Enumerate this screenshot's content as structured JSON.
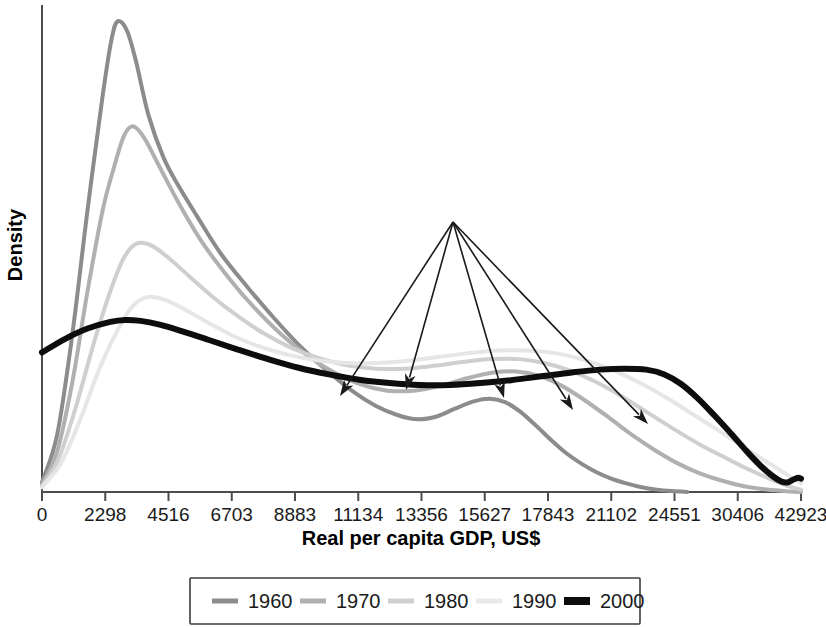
{
  "chart_data": {
    "type": "line",
    "title": "",
    "subtitle": "",
    "xlabel": "Real per capita GDP, US$",
    "ylabel": "Density",
    "grid": false,
    "legend_position": "bottom",
    "x_axis_note": "quantile-spaced: tick labels are unequal in value but equally spaced in pixels",
    "xtick_labels": [
      "0",
      "2298",
      "4516",
      "6703",
      "8883",
      "11134",
      "13356",
      "15627",
      "17843",
      "21102",
      "24551",
      "30406",
      "42923"
    ],
    "xtick_values": [
      0,
      2298,
      4516,
      6703,
      8883,
      11134,
      13356,
      15627,
      17843,
      21102,
      24551,
      30406,
      42923
    ],
    "ytick_labels": [],
    "ylim": [
      0,
      1
    ],
    "series": [
      {
        "name": "1960",
        "color": "#8c8c8c",
        "width": 4,
        "points": [
          [
            0.0,
            0.02
          ],
          [
            0.02,
            0.12
          ],
          [
            0.04,
            0.33
          ],
          [
            0.06,
            0.59
          ],
          [
            0.08,
            0.83
          ],
          [
            0.092,
            0.95
          ],
          [
            0.1,
            0.985
          ],
          [
            0.112,
            0.965
          ],
          [
            0.124,
            0.9
          ],
          [
            0.14,
            0.79
          ],
          [
            0.16,
            0.7
          ],
          [
            0.18,
            0.64
          ],
          [
            0.205,
            0.575
          ],
          [
            0.235,
            0.5
          ],
          [
            0.27,
            0.43
          ],
          [
            0.305,
            0.365
          ],
          [
            0.34,
            0.305
          ],
          [
            0.375,
            0.255
          ],
          [
            0.41,
            0.21
          ],
          [
            0.44,
            0.18
          ],
          [
            0.47,
            0.16
          ],
          [
            0.495,
            0.152
          ],
          [
            0.52,
            0.158
          ],
          [
            0.545,
            0.175
          ],
          [
            0.57,
            0.19
          ],
          [
            0.59,
            0.195
          ],
          [
            0.61,
            0.188
          ],
          [
            0.63,
            0.168
          ],
          [
            0.65,
            0.14
          ],
          [
            0.67,
            0.11
          ],
          [
            0.69,
            0.082
          ],
          [
            0.71,
            0.06
          ],
          [
            0.73,
            0.042
          ],
          [
            0.75,
            0.028
          ],
          [
            0.77,
            0.018
          ],
          [
            0.79,
            0.01
          ],
          [
            0.81,
            0.005
          ],
          [
            0.83,
            0.002
          ],
          [
            0.85,
            0.0
          ]
        ]
      },
      {
        "name": "1970",
        "color": "#b0b0b0",
        "width": 4,
        "points": [
          [
            0.0,
            0.015
          ],
          [
            0.02,
            0.085
          ],
          [
            0.04,
            0.23
          ],
          [
            0.06,
            0.42
          ],
          [
            0.08,
            0.59
          ],
          [
            0.095,
            0.68
          ],
          [
            0.108,
            0.745
          ],
          [
            0.12,
            0.765
          ],
          [
            0.135,
            0.74
          ],
          [
            0.155,
            0.68
          ],
          [
            0.18,
            0.605
          ],
          [
            0.21,
            0.525
          ],
          [
            0.245,
            0.45
          ],
          [
            0.28,
            0.385
          ],
          [
            0.315,
            0.33
          ],
          [
            0.35,
            0.285
          ],
          [
            0.385,
            0.25
          ],
          [
            0.42,
            0.225
          ],
          [
            0.455,
            0.212
          ],
          [
            0.49,
            0.212
          ],
          [
            0.525,
            0.222
          ],
          [
            0.56,
            0.238
          ],
          [
            0.595,
            0.25
          ],
          [
            0.625,
            0.252
          ],
          [
            0.655,
            0.243
          ],
          [
            0.685,
            0.222
          ],
          [
            0.715,
            0.192
          ],
          [
            0.745,
            0.158
          ],
          [
            0.775,
            0.122
          ],
          [
            0.805,
            0.09
          ],
          [
            0.835,
            0.062
          ],
          [
            0.865,
            0.04
          ],
          [
            0.895,
            0.024
          ],
          [
            0.925,
            0.012
          ],
          [
            0.955,
            0.005
          ],
          [
            0.985,
            0.001
          ],
          [
            1.0,
            0.0
          ]
        ]
      },
      {
        "name": "1980",
        "color": "#cfcfcf",
        "width": 4,
        "points": [
          [
            0.0,
            0.012
          ],
          [
            0.022,
            0.07
          ],
          [
            0.045,
            0.18
          ],
          [
            0.068,
            0.31
          ],
          [
            0.09,
            0.42
          ],
          [
            0.108,
            0.49
          ],
          [
            0.125,
            0.52
          ],
          [
            0.145,
            0.515
          ],
          [
            0.168,
            0.488
          ],
          [
            0.195,
            0.45
          ],
          [
            0.225,
            0.408
          ],
          [
            0.258,
            0.368
          ],
          [
            0.292,
            0.332
          ],
          [
            0.328,
            0.302
          ],
          [
            0.365,
            0.28
          ],
          [
            0.402,
            0.265
          ],
          [
            0.44,
            0.258
          ],
          [
            0.478,
            0.258
          ],
          [
            0.516,
            0.264
          ],
          [
            0.554,
            0.272
          ],
          [
            0.592,
            0.278
          ],
          [
            0.628,
            0.278
          ],
          [
            0.662,
            0.27
          ],
          [
            0.696,
            0.254
          ],
          [
            0.73,
            0.23
          ],
          [
            0.764,
            0.2
          ],
          [
            0.798,
            0.166
          ],
          [
            0.832,
            0.132
          ],
          [
            0.866,
            0.1
          ],
          [
            0.9,
            0.072
          ],
          [
            0.93,
            0.048
          ],
          [
            0.958,
            0.028
          ],
          [
            0.98,
            0.014
          ],
          [
            1.0,
            0.005
          ]
        ]
      },
      {
        "name": "1990",
        "color": "#e6e6e6",
        "width": 4,
        "points": [
          [
            0.0,
            0.01
          ],
          [
            0.025,
            0.06
          ],
          [
            0.05,
            0.15
          ],
          [
            0.075,
            0.255
          ],
          [
            0.1,
            0.34
          ],
          [
            0.12,
            0.39
          ],
          [
            0.14,
            0.408
          ],
          [
            0.162,
            0.402
          ],
          [
            0.188,
            0.382
          ],
          [
            0.218,
            0.355
          ],
          [
            0.25,
            0.328
          ],
          [
            0.285,
            0.305
          ],
          [
            0.322,
            0.288
          ],
          [
            0.36,
            0.276
          ],
          [
            0.4,
            0.27
          ],
          [
            0.44,
            0.27
          ],
          [
            0.48,
            0.274
          ],
          [
            0.52,
            0.282
          ],
          [
            0.56,
            0.29
          ],
          [
            0.6,
            0.296
          ],
          [
            0.64,
            0.296
          ],
          [
            0.678,
            0.29
          ],
          [
            0.715,
            0.276
          ],
          [
            0.752,
            0.255
          ],
          [
            0.788,
            0.228
          ],
          [
            0.824,
            0.196
          ],
          [
            0.858,
            0.162
          ],
          [
            0.892,
            0.128
          ],
          [
            0.924,
            0.095
          ],
          [
            0.952,
            0.066
          ],
          [
            0.976,
            0.042
          ],
          [
            0.992,
            0.026
          ],
          [
            1.0,
            0.018
          ]
        ]
      },
      {
        "name": "2000",
        "color": "#0d0d0d",
        "width": 6,
        "points": [
          [
            0.0,
            0.292
          ],
          [
            0.03,
            0.32
          ],
          [
            0.06,
            0.342
          ],
          [
            0.09,
            0.356
          ],
          [
            0.11,
            0.36
          ],
          [
            0.13,
            0.358
          ],
          [
            0.155,
            0.35
          ],
          [
            0.185,
            0.336
          ],
          [
            0.22,
            0.318
          ],
          [
            0.258,
            0.298
          ],
          [
            0.298,
            0.278
          ],
          [
            0.338,
            0.26
          ],
          [
            0.378,
            0.246
          ],
          [
            0.418,
            0.235
          ],
          [
            0.458,
            0.228
          ],
          [
            0.498,
            0.224
          ],
          [
            0.538,
            0.224
          ],
          [
            0.578,
            0.228
          ],
          [
            0.618,
            0.234
          ],
          [
            0.658,
            0.242
          ],
          [
            0.698,
            0.25
          ],
          [
            0.735,
            0.256
          ],
          [
            0.768,
            0.258
          ],
          [
            0.796,
            0.256
          ],
          [
            0.82,
            0.246
          ],
          [
            0.842,
            0.226
          ],
          [
            0.864,
            0.196
          ],
          [
            0.886,
            0.16
          ],
          [
            0.908,
            0.122
          ],
          [
            0.928,
            0.086
          ],
          [
            0.946,
            0.056
          ],
          [
            0.962,
            0.034
          ],
          [
            0.974,
            0.022
          ],
          [
            0.982,
            0.02
          ],
          [
            0.99,
            0.026
          ],
          [
            0.996,
            0.03
          ],
          [
            1.0,
            0.028
          ]
        ]
      }
    ],
    "annotations": {
      "apex": [
        453,
        222
      ],
      "description": "Five arrows fan out from a single point to each curve's secondary (upper-income) mode",
      "arrow_tips": [
        [
          340,
          396
        ],
        [
          406,
          390
        ],
        [
          504,
          398
        ],
        [
          573,
          410
        ],
        [
          648,
          424
        ]
      ]
    }
  },
  "axis": {
    "y_title": "Density",
    "x_title": "Real per capita GDP, US$"
  },
  "legend": {
    "items": [
      {
        "label": "1960",
        "color": "#8c8c8c",
        "width": 5
      },
      {
        "label": "1970",
        "color": "#b0b0b0",
        "width": 5
      },
      {
        "label": "1980",
        "color": "#cfcfcf",
        "width": 5
      },
      {
        "label": "1990",
        "color": "#e9e9e9",
        "width": 5
      },
      {
        "label": "2000",
        "color": "#0d0d0d",
        "width": 8
      }
    ]
  },
  "colors": {
    "axis": "#4d4d4d",
    "text": "#1a1a1a",
    "background": "#ffffff",
    "annotation": "#1a1a1a"
  }
}
